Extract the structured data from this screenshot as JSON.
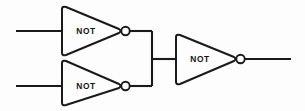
{
  "diagram": {
    "type": "logic-circuit-schematic",
    "background_color": "#fdfdfd",
    "line_color": "#1a1a1a",
    "gates": [
      {
        "id": "not-gate-top",
        "label": "NOT",
        "type": "inverter",
        "position": "upper-left"
      },
      {
        "id": "not-gate-bottom",
        "label": "NOT",
        "type": "inverter",
        "position": "lower-left"
      },
      {
        "id": "not-gate-output",
        "label": "NOT",
        "type": "inverter",
        "position": "right"
      }
    ],
    "nets": [
      {
        "id": "input-wire-top",
        "role": "input"
      },
      {
        "id": "input-wire-bottom",
        "role": "input"
      },
      {
        "id": "tie-bus",
        "role": "shared-node"
      },
      {
        "id": "bus-to-output-gate",
        "role": "internal"
      },
      {
        "id": "output-wire",
        "role": "output"
      }
    ]
  }
}
